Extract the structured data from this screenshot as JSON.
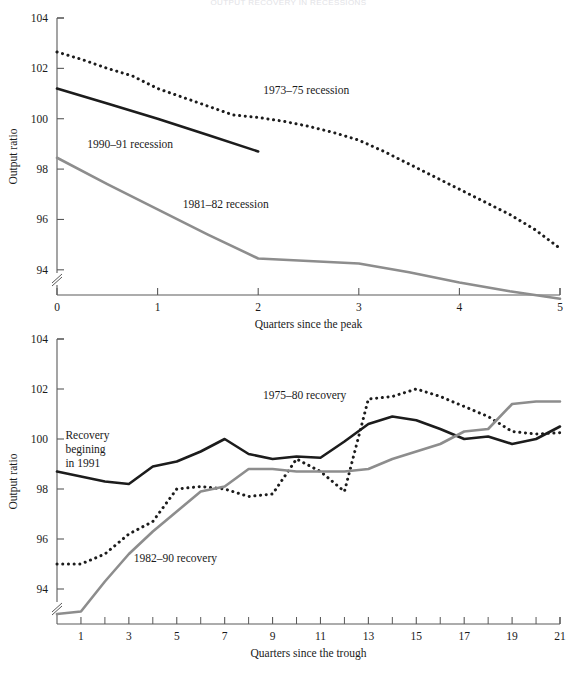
{
  "figure": {
    "title": "OUTPUT RECOVERY IN RECESSIONS",
    "background": "#ffffff"
  },
  "colors": {
    "dark_line": "#1c1c1c",
    "gray_line": "#8d8d8d",
    "axis": "#5a5a5a",
    "text": "#1a1a1a"
  },
  "chart_data": [
    {
      "type": "line",
      "title": "",
      "xlabel": "Quarters since the peak",
      "ylabel": "Output ratio",
      "xlim": [
        0,
        5
      ],
      "ylim": [
        93,
        104
      ],
      "xticks": [
        0,
        1,
        2,
        3,
        4,
        5
      ],
      "xtick_labels": [
        "0",
        "1",
        "2",
        "3",
        "4",
        "5"
      ],
      "yticks": [
        94,
        96,
        98,
        100,
        102,
        104
      ],
      "ytick_labels": [
        "94",
        "96",
        "98",
        "100",
        "102",
        "104"
      ],
      "grid": false,
      "axis_break": true,
      "legend_position": "inline-annotations",
      "series": [
        {
          "name": "1973–75 recession",
          "style": "dotted",
          "color": "#1c1c1c",
          "label_x": 2.05,
          "label_y": 101.0,
          "x": [
            0,
            0.25,
            0.5,
            0.75,
            1.0,
            1.25,
            1.5,
            1.75,
            2.0,
            2.25,
            2.5,
            2.75,
            3.0,
            3.25,
            3.5,
            3.75,
            4.0,
            4.25,
            4.5,
            4.75,
            5.0
          ],
          "y": [
            102.65,
            102.35,
            102.0,
            101.7,
            101.2,
            100.85,
            100.5,
            100.15,
            100.05,
            99.9,
            99.7,
            99.45,
            99.15,
            98.7,
            98.2,
            97.7,
            97.2,
            96.7,
            96.2,
            95.6,
            94.85
          ]
        },
        {
          "name": "1990–91 recession",
          "style": "solid",
          "color": "#1c1c1c",
          "label_x": 0.3,
          "label_y": 98.85,
          "x": [
            0,
            0.5,
            1.0,
            1.5,
            2.0
          ],
          "y": [
            101.2,
            100.6,
            100.0,
            99.35,
            98.7
          ]
        },
        {
          "name": "1981–82 recession",
          "style": "solid",
          "color": "#8d8d8d",
          "label_x": 1.25,
          "label_y": 96.45,
          "x": [
            0,
            0.5,
            1.0,
            1.5,
            2.0,
            2.5,
            3.0,
            3.5,
            4.0,
            4.5,
            5.0
          ],
          "y": [
            98.45,
            97.4,
            96.4,
            95.4,
            94.45,
            94.35,
            94.25,
            93.9,
            93.5,
            93.15,
            92.85
          ]
        }
      ]
    },
    {
      "type": "line",
      "title": "",
      "xlabel": "Quarters since the trough",
      "ylabel": "Output ratio",
      "xlim": [
        0,
        21
      ],
      "ylim": [
        92.6,
        104
      ],
      "xticks": [
        1,
        3,
        5,
        7,
        9,
        11,
        13,
        15,
        17,
        19,
        21
      ],
      "xtick_labels": [
        "1",
        "3",
        "5",
        "7",
        "9",
        "11",
        "13",
        "15",
        "17",
        "19",
        "21"
      ],
      "xticks_minor": [
        2,
        4,
        6,
        8,
        10,
        12,
        14,
        16,
        18,
        20
      ],
      "yticks": [
        94,
        96,
        98,
        100,
        102,
        104
      ],
      "ytick_labels": [
        "94",
        "96",
        "98",
        "100",
        "102",
        "104"
      ],
      "grid": false,
      "axis_break": true,
      "legend_position": "inline-annotations",
      "series": [
        {
          "name": "1975–80 recovery",
          "style": "dotted",
          "color": "#1c1c1c",
          "label_x": 8.6,
          "label_y": 101.6,
          "x": [
            0,
            1,
            2,
            3,
            4,
            5,
            6,
            7,
            8,
            9,
            10,
            11,
            12,
            13,
            14,
            15,
            16,
            17,
            18,
            19,
            20,
            21
          ],
          "y": [
            95.0,
            95.0,
            95.4,
            96.2,
            96.7,
            98.0,
            98.1,
            98.0,
            97.7,
            97.8,
            99.2,
            98.7,
            97.9,
            101.6,
            101.7,
            102.0,
            101.7,
            101.3,
            100.9,
            100.3,
            100.2,
            100.25
          ]
        },
        {
          "name": "Recovery begining in 1991",
          "style": "solid",
          "color": "#1c1c1c",
          "label_x": 0.35,
          "label_y": 100.0,
          "label_lines": [
            "Recovery",
            "begining",
            "in 1991"
          ],
          "x": [
            0,
            1,
            2,
            3,
            4,
            5,
            6,
            7,
            8,
            9,
            10,
            11,
            12,
            13,
            14,
            15,
            16,
            17,
            18,
            19,
            20,
            21
          ],
          "y": [
            98.7,
            98.5,
            98.3,
            98.2,
            98.9,
            99.1,
            99.5,
            100.0,
            99.4,
            99.2,
            99.3,
            99.25,
            99.9,
            100.6,
            100.9,
            100.75,
            100.4,
            100.0,
            100.1,
            99.8,
            100.0,
            100.5
          ]
        },
        {
          "name": "1982–90 recovery",
          "style": "solid",
          "color": "#8d8d8d",
          "label_x": 3.2,
          "label_y": 95.1,
          "x": [
            0,
            1,
            2,
            3,
            4,
            5,
            6,
            7,
            8,
            9,
            10,
            11,
            12,
            13,
            14,
            15,
            16,
            17,
            18,
            19,
            20,
            21
          ],
          "y": [
            93.0,
            93.1,
            94.3,
            95.4,
            96.3,
            97.1,
            97.9,
            98.1,
            98.8,
            98.8,
            98.7,
            98.7,
            98.7,
            98.8,
            99.2,
            99.5,
            99.8,
            100.3,
            100.4,
            101.4,
            101.5,
            101.5
          ]
        }
      ]
    }
  ]
}
